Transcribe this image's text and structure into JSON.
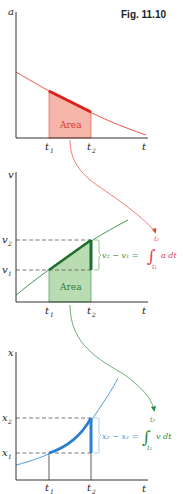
{
  "figure": {
    "title": "Fig. 11.10",
    "colors": {
      "accel": "#e8443a",
      "accel_fill": "#f5b5a8",
      "velocity": "#2e8b3e",
      "velocity_fill": "#b9dcb3",
      "position": "#3a8fd8",
      "axis": "#333333",
      "dash": "#555555"
    },
    "panels": [
      {
        "id": "acceleration",
        "y_label": "a",
        "x_label": "t",
        "ticks": [
          "t1",
          "t2"
        ],
        "tick_labels": {
          "t1_base": "t",
          "t1_sub": "1",
          "t2_base": "t",
          "t2_sub": "2"
        },
        "area_label": "Area"
      },
      {
        "id": "velocity",
        "y_label": "v",
        "x_label": "t",
        "tick_labels": {
          "t1_base": "t",
          "t1_sub": "1",
          "t2_base": "t",
          "t2_sub": "2"
        },
        "y_ticks": {
          "v2_base": "v",
          "v2_sub": "2",
          "v1_base": "v",
          "v1_sub": "1"
        },
        "area_label": "Area",
        "equation": {
          "lhs": "v₂ − v₁ =",
          "integral_upper": "t₂",
          "integral_lower": "t₁",
          "integrand": "a dt"
        }
      },
      {
        "id": "position",
        "y_label": "x",
        "x_label": "t",
        "tick_labels": {
          "t1_base": "t",
          "t1_sub": "1",
          "t2_base": "t",
          "t2_sub": "2"
        },
        "y_ticks": {
          "x2_base": "x",
          "x2_sub": "2",
          "x1_base": "x",
          "x1_sub": "1"
        },
        "equation": {
          "lhs": "x₂ − x₁ =",
          "integral_upper": "t₂",
          "integral_lower": "t₁",
          "integrand": "v dt"
        }
      }
    ]
  }
}
